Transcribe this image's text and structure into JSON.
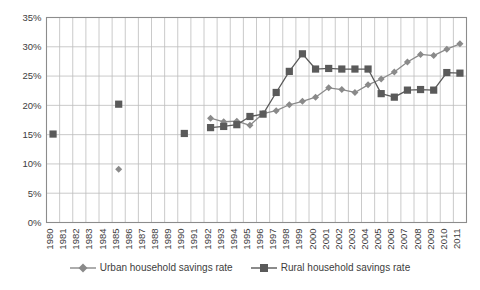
{
  "chart_data": {
    "type": "line",
    "title": "",
    "subtitle": "",
    "xlabel": "",
    "ylabel": "",
    "grid": true,
    "legend_position": "bottom",
    "xlim": [
      1980,
      2011
    ],
    "ylim": [
      0,
      35
    ],
    "ytick_labels": [
      "0%",
      "5%",
      "10%",
      "15%",
      "20%",
      "25%",
      "30%",
      "35%"
    ],
    "ytick_values": [
      0,
      5,
      10,
      15,
      20,
      25,
      30,
      35
    ],
    "categories": [
      "1980",
      "1981",
      "1982",
      "1983",
      "1984",
      "1985",
      "1986",
      "1987",
      "1988",
      "1989",
      "1990",
      "1991",
      "1992",
      "1993",
      "1994",
      "1995",
      "1996",
      "1997",
      "1998",
      "1999",
      "2000",
      "2001",
      "2002",
      "2003",
      "2004",
      "2005",
      "2006",
      "2007",
      "2008",
      "2009",
      "2010",
      "2011"
    ],
    "series": [
      {
        "name": "Urban household savings rate",
        "marker": "diamond",
        "color": "#8a8a8a",
        "values": [
          null,
          null,
          null,
          null,
          null,
          9.1,
          null,
          null,
          null,
          null,
          15.2,
          null,
          17.8,
          17.2,
          17.3,
          16.6,
          18.6,
          19.1,
          20.1,
          20.7,
          21.4,
          23.0,
          22.7,
          22.2,
          23.5,
          24.5,
          25.7,
          27.4,
          28.7,
          28.5,
          29.6,
          30.5
        ]
      },
      {
        "name": "Rural household savings rate",
        "marker": "square",
        "color": "#5a5a5a",
        "values": [
          15.1,
          null,
          null,
          null,
          null,
          20.2,
          null,
          null,
          null,
          null,
          15.2,
          null,
          16.2,
          16.4,
          16.7,
          18.1,
          18.5,
          22.2,
          25.8,
          28.8,
          26.2,
          26.3,
          26.2,
          26.2,
          26.2,
          22.0,
          21.4,
          22.6,
          22.7,
          22.6,
          25.6,
          25.5
        ]
      }
    ]
  },
  "legend": {
    "entries": [
      {
        "label": "Urban household savings rate",
        "marker": "diamond"
      },
      {
        "label": "Rural household savings rate",
        "marker": "square"
      }
    ]
  },
  "colors": {
    "urban": "#8a8a8a",
    "rural": "#5a5a5a",
    "grid": "#bdbdbd",
    "frame": "#8c8c8c",
    "text": "#3d3d3d",
    "background": "#ffffff"
  }
}
